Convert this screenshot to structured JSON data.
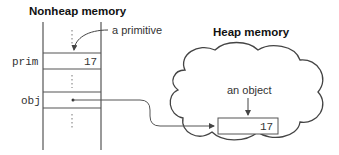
{
  "nonheap": {
    "title": "Nonheap memory",
    "annotation": "a primitive",
    "slots": [
      {
        "name": "prim",
        "value": "17"
      },
      {
        "name": "obj",
        "value": ""
      }
    ],
    "ellipsis": "⋮"
  },
  "heap": {
    "title": "Heap memory",
    "annotation": "an object",
    "object_value": "17"
  },
  "colors": {
    "line": "#555555",
    "text": "#333333",
    "title": "#111111"
  }
}
